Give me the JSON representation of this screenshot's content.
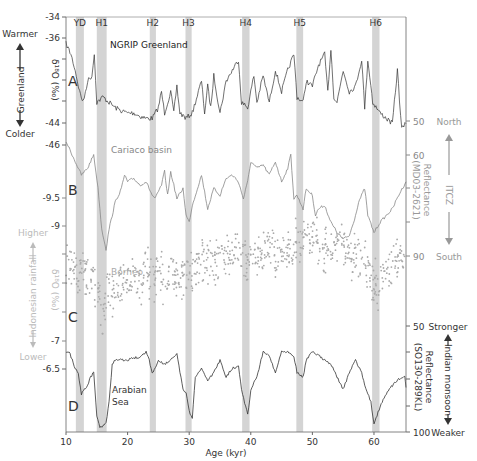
{
  "chart_data": {
    "type": "line",
    "title": "",
    "xlabel": "Age (kyr)",
    "xlim": [
      10,
      65.2
    ],
    "xticks": [
      10,
      20,
      30,
      40,
      50,
      60
    ],
    "events": [
      {
        "label": "YD",
        "start": 11.6,
        "end": 12.9
      },
      {
        "label": "H1",
        "start": 15.0,
        "end": 16.6
      },
      {
        "label": "H2",
        "start": 23.6,
        "end": 24.6
      },
      {
        "label": "H3",
        "start": 29.4,
        "end": 30.4
      },
      {
        "label": "H4",
        "start": 38.6,
        "end": 39.8
      },
      {
        "label": "H5",
        "start": 47.4,
        "end": 48.5
      },
      {
        "label": "H6",
        "start": 59.7,
        "end": 60.9
      }
    ],
    "panels": [
      {
        "letter": "A",
        "name": "NGRIP Greenland",
        "series_label": "NGRIP Greenland",
        "ylabel": "δ18O (‰)",
        "axis": "left",
        "yticks": [
          -34,
          -36,
          -44,
          -46
        ],
        "ylim": [
          -34,
          -46
        ],
        "left_annot": {
          "top": "Warmer",
          "middle": "Greenland",
          "bottom": "Colder"
        },
        "color": "#333333",
        "points": [
          [
            10,
            -36.5
          ],
          [
            10.8,
            -37.5
          ],
          [
            11.5,
            -39
          ],
          [
            12.2,
            -41
          ],
          [
            12.8,
            -42
          ],
          [
            13.5,
            -40
          ],
          [
            14.2,
            -39.5
          ],
          [
            14.6,
            -37.5
          ],
          [
            15.0,
            -42
          ],
          [
            16,
            -41.5
          ],
          [
            17,
            -42
          ],
          [
            18,
            -42.5
          ],
          [
            19,
            -42.8
          ],
          [
            20,
            -43
          ],
          [
            21,
            -43
          ],
          [
            22,
            -43.3
          ],
          [
            23,
            -43.5
          ],
          [
            24,
            -43.5
          ],
          [
            25,
            -42.5
          ],
          [
            25.5,
            -41
          ],
          [
            26,
            -43
          ],
          [
            27,
            -41
          ],
          [
            27.5,
            -43
          ],
          [
            28,
            -40.5
          ],
          [
            28.5,
            -43
          ],
          [
            29.5,
            -43.5
          ],
          [
            30.5,
            -43
          ],
          [
            31,
            -42
          ],
          [
            32,
            -40
          ],
          [
            32.5,
            -43
          ],
          [
            33,
            -40.5
          ],
          [
            33.5,
            -42.5
          ],
          [
            34,
            -39.5
          ],
          [
            35,
            -43
          ],
          [
            36,
            -40
          ],
          [
            37,
            -39
          ],
          [
            38,
            -38
          ],
          [
            38.5,
            -42
          ],
          [
            39.5,
            -42.5
          ],
          [
            40.5,
            -39.5
          ],
          [
            41,
            -42
          ],
          [
            42,
            -39.5
          ],
          [
            43,
            -42
          ],
          [
            44,
            -39
          ],
          [
            45,
            -41
          ],
          [
            46,
            -39
          ],
          [
            47,
            -37.5
          ],
          [
            47.5,
            -41.5
          ],
          [
            48.5,
            -42
          ],
          [
            49,
            -40
          ],
          [
            50,
            -40.5
          ],
          [
            51,
            -38.5
          ],
          [
            52,
            -37.5
          ],
          [
            52.5,
            -41
          ],
          [
            53,
            -37
          ],
          [
            53.5,
            -41.5
          ],
          [
            54,
            -42
          ],
          [
            55,
            -39
          ],
          [
            56,
            -41
          ],
          [
            57,
            -40.5
          ],
          [
            58,
            -38
          ],
          [
            58.5,
            -42.5
          ],
          [
            59,
            -38
          ],
          [
            59.8,
            -42
          ],
          [
            61,
            -43
          ],
          [
            62,
            -43.5
          ],
          [
            63,
            -44
          ],
          [
            63.8,
            -39
          ],
          [
            64.5,
            -44.5
          ],
          [
            65.2,
            -44
          ]
        ]
      },
      {
        "letter": "B",
        "name": "Cariaco basin",
        "series_label": "Cariaco basin",
        "ylabel": "Reflectance (MD03-2621)",
        "axis": "right",
        "yticks": [
          50,
          60,
          90
        ],
        "ylim": [
          50,
          90
        ],
        "right_annot": {
          "top": "North",
          "middle": "ITCZ",
          "bottom": "South"
        },
        "color": "#888888",
        "points": [
          [
            10,
            56
          ],
          [
            10.5,
            58
          ],
          [
            11.5,
            62
          ],
          [
            12.5,
            66
          ],
          [
            13.5,
            64
          ],
          [
            14.5,
            60
          ],
          [
            15.2,
            70
          ],
          [
            15.8,
            82
          ],
          [
            16.5,
            88
          ],
          [
            17,
            82
          ],
          [
            17.5,
            78
          ],
          [
            18,
            74
          ],
          [
            19,
            70
          ],
          [
            19.5,
            66
          ],
          [
            20,
            68
          ],
          [
            21,
            67
          ],
          [
            22,
            69
          ],
          [
            23,
            68
          ],
          [
            24,
            72
          ],
          [
            24.5,
            73
          ],
          [
            25.5,
            69
          ],
          [
            26,
            65
          ],
          [
            26.5,
            72
          ],
          [
            27,
            65
          ],
          [
            28,
            73
          ],
          [
            29,
            70
          ],
          [
            29.5,
            78
          ],
          [
            30,
            80
          ],
          [
            30.5,
            75
          ],
          [
            31,
            72
          ],
          [
            32,
            66
          ],
          [
            33,
            76
          ],
          [
            34,
            70
          ],
          [
            35,
            72
          ],
          [
            36,
            67
          ],
          [
            37,
            66
          ],
          [
            38,
            68
          ],
          [
            38.8,
            73
          ],
          [
            39.5,
            68
          ],
          [
            40,
            62
          ],
          [
            41,
            64
          ],
          [
            42,
            63
          ],
          [
            43,
            66
          ],
          [
            44,
            62
          ],
          [
            45,
            68
          ],
          [
            46,
            64
          ],
          [
            46.5,
            60
          ],
          [
            47,
            73
          ],
          [
            47.5,
            72
          ],
          [
            48.5,
            76
          ],
          [
            49,
            70
          ],
          [
            50,
            72
          ],
          [
            50.5,
            78
          ],
          [
            51,
            76
          ],
          [
            52,
            75
          ],
          [
            53,
            80
          ],
          [
            54,
            83
          ],
          [
            55,
            85
          ],
          [
            56,
            84
          ],
          [
            57,
            78
          ],
          [
            57.5,
            74
          ],
          [
            58.5,
            70
          ],
          [
            59,
            78
          ],
          [
            60,
            83
          ],
          [
            61,
            80
          ],
          [
            62,
            78
          ],
          [
            63,
            76
          ],
          [
            64,
            72
          ],
          [
            65.2,
            68
          ]
        ]
      },
      {
        "letter": "C",
        "name": "Borneo",
        "series_label": "Borneo",
        "ylabel": "δ18O (‰)",
        "axis": "left",
        "yticks": [
          -9.5,
          -9,
          -7
        ],
        "ylim": [
          -9.5,
          -7
        ],
        "left_annot": {
          "top": "Higher",
          "middle": "Indonesian rainfall",
          "bottom": "Lower"
        },
        "color": "#aaaaaa",
        "scatter_bands": [
          [
            10,
            -8.4,
            0.35
          ],
          [
            12,
            -8.1,
            0.35
          ],
          [
            14,
            -8.2,
            0.4
          ],
          [
            16,
            -7.6,
            0.4
          ],
          [
            17,
            -7.9,
            0.35
          ],
          [
            18,
            -7.9,
            0.35
          ],
          [
            20,
            -8.1,
            0.35
          ],
          [
            22,
            -8.1,
            0.35
          ],
          [
            24,
            -8.2,
            0.35
          ],
          [
            26,
            -8.1,
            0.35
          ],
          [
            28,
            -8.2,
            0.35
          ],
          [
            30,
            -8.2,
            0.4
          ],
          [
            32,
            -8.4,
            0.35
          ],
          [
            34,
            -8.4,
            0.35
          ],
          [
            36,
            -8.5,
            0.35
          ],
          [
            38,
            -8.5,
            0.35
          ],
          [
            40,
            -8.4,
            0.35
          ],
          [
            42,
            -8.6,
            0.35
          ],
          [
            44,
            -8.5,
            0.35
          ],
          [
            46,
            -8.6,
            0.35
          ],
          [
            48,
            -8.7,
            0.35
          ],
          [
            50,
            -8.8,
            0.35
          ],
          [
            52,
            -8.6,
            0.35
          ],
          [
            54,
            -8.7,
            0.35
          ],
          [
            56,
            -8.5,
            0.35
          ],
          [
            58,
            -8.5,
            0.35
          ],
          [
            60,
            -8.0,
            0.4
          ],
          [
            62,
            -8.2,
            0.35
          ],
          [
            64,
            -8.4,
            0.35
          ],
          [
            65,
            -8.5,
            0.35
          ]
        ]
      },
      {
        "letter": "D",
        "name": "Arabian Sea",
        "series_label": "Arabian Sea",
        "ylabel": "Reflectance (SO130-289KL)",
        "axis": "right",
        "yticks": [
          50,
          100
        ],
        "ylim": [
          50,
          100
        ],
        "right_annot": {
          "top": "Stronger",
          "middle": "Indian monsoon",
          "bottom": "Weaker"
        },
        "left_yticks_shared": [
          -7,
          -6.5
        ],
        "color": "#333333",
        "points": [
          [
            10,
            63
          ],
          [
            10.5,
            62
          ],
          [
            11,
            66
          ],
          [
            11.5,
            70
          ],
          [
            12,
            72
          ],
          [
            12.5,
            82
          ],
          [
            13,
            80
          ],
          [
            13.5,
            78
          ],
          [
            14,
            74
          ],
          [
            14.5,
            72
          ],
          [
            15,
            92
          ],
          [
            15.5,
            98
          ],
          [
            16.5,
            96
          ],
          [
            17,
            86
          ],
          [
            17.5,
            68
          ],
          [
            18,
            66
          ],
          [
            19,
            66
          ],
          [
            20,
            66
          ],
          [
            21,
            65
          ],
          [
            22,
            65
          ],
          [
            23,
            62
          ],
          [
            23.5,
            66
          ],
          [
            24,
            72
          ],
          [
            24.5,
            70
          ],
          [
            25,
            66
          ],
          [
            26,
            68
          ],
          [
            27,
            66
          ],
          [
            28,
            63
          ],
          [
            28.5,
            72
          ],
          [
            29,
            80
          ],
          [
            29.5,
            82
          ],
          [
            30,
            90
          ],
          [
            30.5,
            94
          ],
          [
            31,
            74
          ],
          [
            32,
            70
          ],
          [
            33,
            76
          ],
          [
            34,
            72
          ],
          [
            35,
            66
          ],
          [
            36,
            74
          ],
          [
            37,
            70
          ],
          [
            38,
            69
          ],
          [
            38.5,
            80
          ],
          [
            39.5,
            92
          ],
          [
            40,
            80
          ],
          [
            41,
            74
          ],
          [
            42,
            62
          ],
          [
            43,
            64
          ],
          [
            44,
            72
          ],
          [
            45,
            62
          ],
          [
            46,
            62
          ],
          [
            47,
            64
          ],
          [
            47.5,
            72
          ],
          [
            48.5,
            74
          ],
          [
            49,
            66
          ],
          [
            50,
            62
          ],
          [
            51,
            64
          ],
          [
            52,
            66
          ],
          [
            53,
            68
          ],
          [
            54,
            74
          ],
          [
            55,
            80
          ],
          [
            56,
            72
          ],
          [
            57,
            66
          ],
          [
            58,
            72
          ],
          [
            58.5,
            78
          ],
          [
            59.5,
            86
          ],
          [
            60,
            96
          ],
          [
            61,
            88
          ],
          [
            62,
            82
          ],
          [
            63,
            78
          ],
          [
            64,
            75
          ],
          [
            65,
            74
          ],
          [
            65.2,
            79
          ]
        ]
      }
    ],
    "right_ticks_d": [
      50,
      100
    ],
    "left_ticks_d": [
      -7,
      -6.5
    ]
  },
  "labels": {
    "xlabel": "Age (kyr)",
    "xticks": [
      "10",
      "20",
      "30",
      "40",
      "50",
      "60"
    ],
    "panel_letters": [
      "A",
      "B",
      "C",
      "D"
    ],
    "series_names": [
      "NGRIP Greenland",
      "Cariaco basin",
      "Borneo",
      "Arabian",
      "Sea"
    ],
    "left_ticks": [
      "-34",
      "-36",
      "-44",
      "-46",
      "-9.5",
      "-9",
      "-7",
      "-6.5"
    ],
    "right_ticks": [
      "50",
      "60",
      "90",
      "50",
      "100"
    ],
    "greenland": {
      "top": "Warmer",
      "middle": "Greenland",
      "bottom": "Colder",
      "ylabel": "δ¹⁸O (‰)"
    },
    "itcz": {
      "top": "North",
      "middle": "ITCZ",
      "bottom": "South",
      "ylabel1": "Reflectance",
      "ylabel2": "(MD03-2621)"
    },
    "indo": {
      "top": "Higher",
      "middle": "Indonesian rainfall",
      "bottom": "Lower",
      "ylabel": "δ¹⁸O (‰)"
    },
    "monsoon": {
      "top": "Stronger",
      "middle": "Indian monsoon",
      "bottom": "Weaker",
      "ylabel1": "Reflectance",
      "ylabel2": "(SO130-289KL)"
    }
  }
}
